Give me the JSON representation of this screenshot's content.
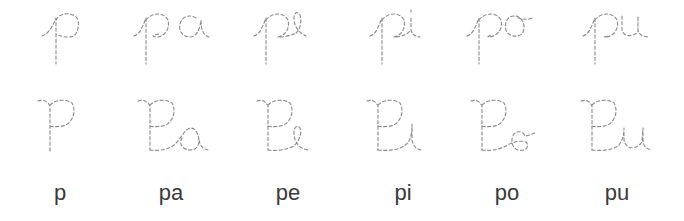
{
  "worksheet": {
    "columns": [
      {
        "syllable": "p",
        "lowercase_trace": "p",
        "uppercase_trace": "P",
        "print_label": "p"
      },
      {
        "syllable": "pa",
        "lowercase_trace": "pa",
        "uppercase_trace": "Pa",
        "print_label": "pa"
      },
      {
        "syllable": "pe",
        "lowercase_trace": "pe",
        "uppercase_trace": "Pe",
        "print_label": "pe"
      },
      {
        "syllable": "pi",
        "lowercase_trace": "pi",
        "uppercase_trace": "Pi",
        "print_label": "pi"
      },
      {
        "syllable": "po",
        "lowercase_trace": "po",
        "uppercase_trace": "Po",
        "print_label": "po"
      },
      {
        "syllable": "pu",
        "lowercase_trace": "pu",
        "uppercase_trace": "Pu",
        "print_label": "pu"
      }
    ],
    "rows": [
      "lowercase-cursive-tracing",
      "uppercase-cursive-tracing",
      "print-labels"
    ],
    "trace_color": "#8a8a8a",
    "label_color": "#3a3a3a",
    "background": "#ffffff"
  }
}
